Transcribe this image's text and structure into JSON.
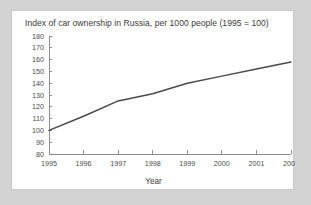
{
  "chart_data": {
    "type": "line",
    "title": "Index of car ownership in Russia, per 1000 people (1995 = 100)",
    "xlabel": "Year",
    "ylabel": "",
    "categories": [
      "1995",
      "1996",
      "1997",
      "1998",
      "1999",
      "2000",
      "2001",
      "2002"
    ],
    "x": [
      1995,
      1996,
      1997,
      1998,
      1999,
      2000,
      2001,
      2002
    ],
    "values": [
      100,
      112,
      125,
      131,
      140,
      146,
      152,
      158
    ],
    "series": [
      {
        "name": "Index of car ownership",
        "values": [
          100,
          112,
          125,
          131,
          140,
          146,
          152,
          158
        ]
      }
    ],
    "ylim": [
      80,
      180
    ],
    "xlim": [
      1995,
      2002
    ],
    "yticks": [
      80,
      90,
      100,
      110,
      120,
      130,
      140,
      150,
      160,
      170,
      180
    ],
    "ytick_labels": [
      "180",
      "170",
      "160",
      "150",
      "140",
      "130",
      "120",
      "110",
      "100",
      "90",
      "80"
    ],
    "xticks": [
      1995,
      1996,
      1997,
      1998,
      1999,
      2000,
      2001,
      2002
    ],
    "grid": false,
    "legend": false,
    "line_color": "#4a4a4a",
    "axis_color": "#8c8c8c",
    "plot_background": "#ffffff",
    "page_background": "#d2d2d2"
  }
}
